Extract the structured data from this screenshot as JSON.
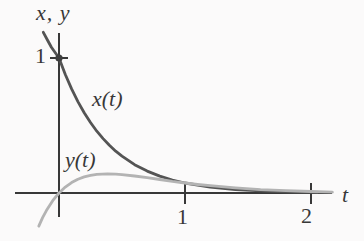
{
  "figure": {
    "background": "#fbfafa",
    "axis_color": "#383838",
    "text_color": "#383838"
  },
  "labels": {
    "y_axis_title": "x, y",
    "t_axis_title": "t",
    "y_tick_1": "1",
    "t_tick_1": "1",
    "t_tick_2": "2",
    "curve_x_label": "x(t)",
    "curve_y_label": "y(t)"
  },
  "chart_data": {
    "type": "line",
    "title": "",
    "xlabel": "t",
    "ylabel": "x, y",
    "xlim": [
      -0.35,
      2.42
    ],
    "ylim": [
      -0.35,
      1.19
    ],
    "x_ticks": [
      1,
      2
    ],
    "y_ticks": [
      1
    ],
    "grid": false,
    "legend_position": "none",
    "annotations": [
      {
        "text": "x(t)",
        "near_t": 0.45,
        "near_value": 0.75
      },
      {
        "text": "y(t)",
        "near_t": 0.2,
        "near_value": 0.25
      }
    ],
    "marker_point": {
      "t": 0,
      "value": 1,
      "color": "#3f3f3f",
      "radius_px": 3.6
    },
    "axis_color": "#383838",
    "series": [
      {
        "name": "x(t)",
        "color": "#545454",
        "width_px": 2.8,
        "points": [
          [
            -0.125,
            1.19
          ],
          [
            -0.09,
            1.13
          ],
          [
            -0.06,
            1.08
          ],
          [
            0,
            1
          ],
          [
            0.05,
            0.878
          ],
          [
            0.1,
            0.771
          ],
          [
            0.15,
            0.677
          ],
          [
            0.2,
            0.595
          ],
          [
            0.25,
            0.522
          ],
          [
            0.3,
            0.458
          ],
          [
            0.35,
            0.403
          ],
          [
            0.4,
            0.353
          ],
          [
            0.45,
            0.31
          ],
          [
            0.5,
            0.273
          ],
          [
            0.6,
            0.21
          ],
          [
            0.7,
            0.162
          ],
          [
            0.8,
            0.125
          ],
          [
            0.9,
            0.096
          ],
          [
            1.0,
            0.074
          ],
          [
            1.2,
            0.044
          ],
          [
            1.4,
            0.026
          ],
          [
            1.6,
            0.016
          ],
          [
            1.8,
            0.009
          ],
          [
            2.05,
            0.005
          ]
        ]
      },
      {
        "name": "y(t)",
        "color": "#b3b3b3",
        "width_px": 2.8,
        "points": [
          [
            -0.16,
            -0.245
          ],
          [
            -0.13,
            -0.182
          ],
          [
            -0.1,
            -0.13
          ],
          [
            -0.05,
            -0.057
          ],
          [
            0,
            0
          ],
          [
            0.05,
            0.044
          ],
          [
            0.1,
            0.077
          ],
          [
            0.15,
            0.102
          ],
          [
            0.2,
            0.119
          ],
          [
            0.25,
            0.131
          ],
          [
            0.3,
            0.138
          ],
          [
            0.385,
            0.142
          ],
          [
            0.45,
            0.14
          ],
          [
            0.5,
            0.136
          ],
          [
            0.6,
            0.126
          ],
          [
            0.7,
            0.113
          ],
          [
            0.8,
            0.1
          ],
          [
            0.9,
            0.086
          ],
          [
            1.0,
            0.074
          ],
          [
            1.1,
            0.063
          ],
          [
            1.2,
            0.054
          ],
          [
            1.4,
            0.038
          ],
          [
            1.6,
            0.025
          ],
          [
            1.8,
            0.017
          ],
          [
            2.0,
            0.011
          ],
          [
            2.17,
            0.007
          ]
        ]
      }
    ]
  }
}
